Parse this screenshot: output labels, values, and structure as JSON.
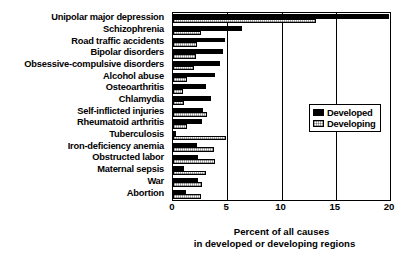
{
  "chart_data": {
    "type": "bar",
    "orientation": "horizontal",
    "title": "",
    "xlabel_line1": "Percent of all causes",
    "xlabel_line2": "in developed or developing regions",
    "ylabel": "",
    "xlim": [
      0,
      20
    ],
    "xticks": [
      0,
      5,
      10,
      15,
      20
    ],
    "xtick_labels": [
      "0",
      "5",
      "10",
      "15",
      "20"
    ],
    "grid": true,
    "legend_position": "middle-right",
    "categories": [
      "Unipolar major depression",
      "Schizophrenia",
      "Road traffic accidents",
      "Bipolar disorders",
      "Obsessive-compulsive disorders",
      "Alcohol abuse",
      "Osteoarthritis",
      "Chlamydia",
      "Self-inflicted injuries",
      "Rheumatoid arthritis",
      "Tuberculosis",
      "Iron-deficiency anemia",
      "Obstructed labor",
      "Maternal sepsis",
      "War",
      "Abortion"
    ],
    "series": [
      {
        "name": "Developed",
        "color": "#000000",
        "values": [
          19.9,
          6.4,
          4.8,
          4.6,
          4.3,
          3.9,
          3.0,
          3.5,
          2.8,
          2.7,
          0.3,
          2.2,
          2.3,
          1.0,
          2.3,
          1.2
        ]
      },
      {
        "name": "Developing",
        "color": "#ffffff",
        "values": [
          13.2,
          2.6,
          2.2,
          2.1,
          1.9,
          1.3,
          0.9,
          1.0,
          3.1,
          1.3,
          4.9,
          3.8,
          3.9,
          3.0,
          2.7,
          2.6
        ]
      }
    ]
  },
  "legend": {
    "items": [
      {
        "label": "Developed"
      },
      {
        "label": "Developing"
      }
    ]
  }
}
